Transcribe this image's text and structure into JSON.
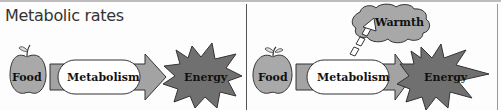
{
  "title": "Metabolic rates",
  "left_panel": {
    "food": "Food",
    "process": "Metabolism",
    "output": "Energy"
  },
  "right_panel": {
    "food": "Food",
    "process": "Metabolism",
    "output": "Energy",
    "byproduct": "Warmth"
  },
  "colors": {
    "apple": "#a9a9a9",
    "arrow": "#a0a0a0",
    "star": "#707070",
    "cloud": "#a8a8a8"
  }
}
